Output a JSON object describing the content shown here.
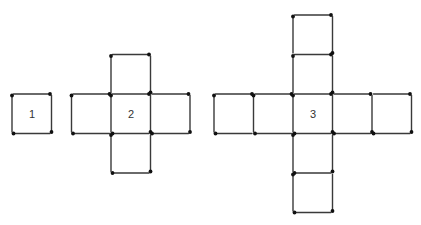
{
  "figures": [
    {
      "label": "1",
      "description": "single square made of 4 matchsticks",
      "cells": [
        [
          0,
          0
        ]
      ],
      "origin": [
        12,
        94
      ],
      "label_pos": [
        32,
        115
      ]
    },
    {
      "label": "2",
      "description": "plus/cross shape of 5 squares",
      "cells": [
        [
          0,
          0
        ],
        [
          0,
          -1
        ],
        [
          0,
          1
        ],
        [
          -1,
          0
        ],
        [
          1,
          0
        ]
      ],
      "origin": [
        111,
        94
      ],
      "label_pos": [
        131,
        115
      ]
    },
    {
      "label": "3",
      "description": "larger cross shape of 9 squares (arms of length 2)",
      "cells": [
        [
          0,
          0
        ],
        [
          0,
          -1
        ],
        [
          0,
          -2
        ],
        [
          0,
          1
        ],
        [
          0,
          2
        ],
        [
          -1,
          0
        ],
        [
          -2,
          0
        ],
        [
          1,
          0
        ],
        [
          2,
          0
        ]
      ],
      "origin": [
        293,
        94
      ],
      "label_pos": [
        313,
        115
      ]
    }
  ],
  "style": {
    "unit": 39.5,
    "stick_color": "#3a3a3a",
    "head_color": "#111111",
    "background": "#ffffff"
  }
}
